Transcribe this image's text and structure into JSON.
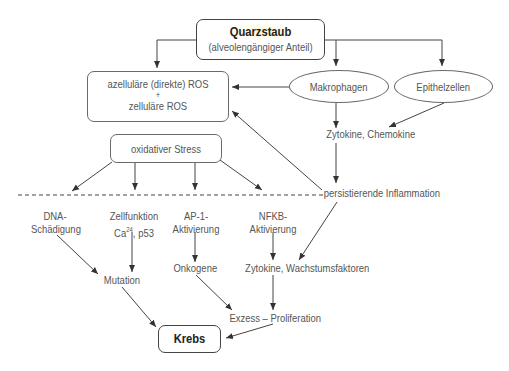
{
  "title": "Quarzstaub",
  "source": {
    "title": "Quarzstaub",
    "subtitle": "(alveolengängiger Anteil)"
  },
  "ros_box": {
    "line1": "azelluläre (direkte) ROS",
    "plus": "+",
    "line2": "zelluläre ROS"
  },
  "cells": {
    "macrophages": "Makrophagen",
    "epithelial": "Epithelzellen"
  },
  "cytokines_chemokines": "Zytokine, Chemokine",
  "oxidative_stress": "oxidativer Stress",
  "inflammation": "persistierende Inflammation",
  "pathways": {
    "dna": {
      "line1": "DNA-",
      "line2": "Schädigung"
    },
    "cell_function": {
      "line1": "Zellfunktion",
      "line2_prefix": "Ca",
      "line2_sup": "24",
      "line2_suffix": ", p53"
    },
    "ap1": {
      "line1": "AP-1-",
      "line2": "Aktivierung"
    },
    "nfkb": {
      "line1": "NFKB-",
      "line2": "Aktivierung"
    }
  },
  "mutation": "Mutation",
  "oncogenes": "Onkogene",
  "growth_factors": "Zytokine, Wachstumsfaktoren",
  "proliferation": "Exzess – Proliferation",
  "outcome": "Krebs",
  "colors": {
    "line": "#444444",
    "box_border": "#6a6a6a",
    "text": "#555555",
    "highlight": "#fff7c2"
  }
}
